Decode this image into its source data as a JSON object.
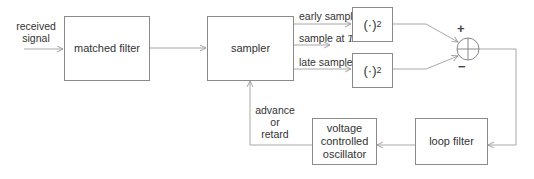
{
  "diagram": {
    "input": {
      "label_line1": "received",
      "label_line2": "signal"
    },
    "blocks": {
      "matched_filter": "matched filter",
      "sampler": "sampler",
      "square_early": {
        "base": "(·)",
        "exp": "2"
      },
      "square_late": {
        "base": "(·)",
        "exp": "2"
      },
      "loop_filter": "loop filter",
      "vco": {
        "line1": "voltage",
        "line2": "controlled",
        "line3": "oscillator"
      }
    },
    "sampler_outputs": {
      "early": "early sample",
      "ontime_prefix": "sample at ",
      "ontime_symbol": "T",
      "late": "late sample"
    },
    "summer": {
      "plus": "+",
      "minus": "−"
    },
    "feedback": {
      "line1": "advance",
      "line2": "or",
      "line3": "retard"
    },
    "colors": {
      "line": "#a0a0a0",
      "box_border": "#8a8a8a",
      "text": "#333333"
    }
  }
}
